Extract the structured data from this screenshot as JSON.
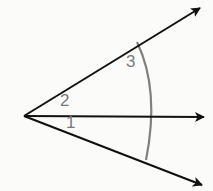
{
  "diagram": {
    "type": "angles-from-common-vertex",
    "vertex": {
      "x": 24,
      "y": 116
    },
    "rays": [
      {
        "name": "upper-ray",
        "end": {
          "x": 202,
          "y": 6
        }
      },
      {
        "name": "middle-ray",
        "end": {
          "x": 206,
          "y": 117
        }
      },
      {
        "name": "lower-ray",
        "end": {
          "x": 204,
          "y": 186
        }
      }
    ],
    "arc": {
      "color": "#808080",
      "start": {
        "x": 137,
        "y": 42
      },
      "mid": {
        "x": 154,
        "y": 117
      },
      "end": {
        "x": 146,
        "y": 160
      }
    },
    "angle_labels": [
      {
        "text": "1",
        "x": 66,
        "y": 114
      },
      {
        "text": "2",
        "x": 60,
        "y": 92
      },
      {
        "text": "3",
        "x": 126,
        "y": 53
      }
    ],
    "colors": {
      "ray": "#111111",
      "arc": "#808080",
      "label": "#7a7a7a",
      "background": "#fbfbfa"
    }
  }
}
